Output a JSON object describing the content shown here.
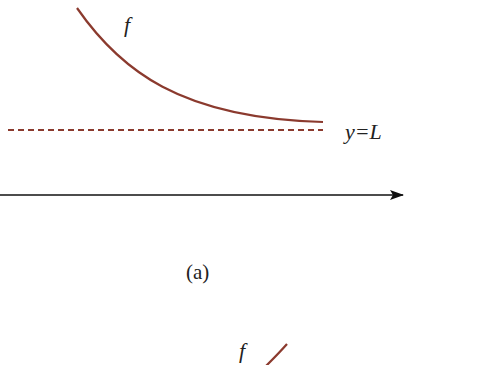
{
  "panel_a": {
    "function_label": "f",
    "asymptote_label": "y=L",
    "caption": "(a)",
    "curve_color": "#8b3a2e",
    "axis_color": "#111111"
  },
  "panel_b": {
    "function_label": "f",
    "curve_color": "#8b3a2e"
  }
}
